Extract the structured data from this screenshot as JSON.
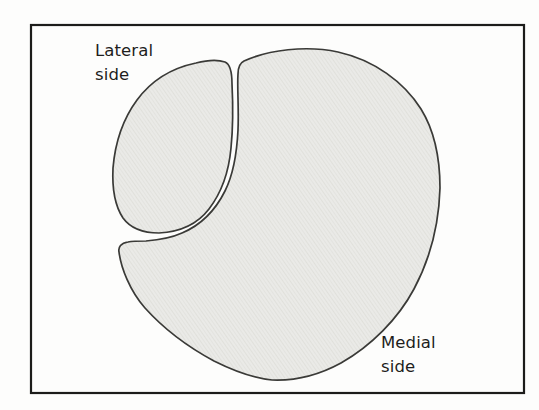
{
  "figure": {
    "labels": {
      "lateral": "Lateral\nside",
      "medial": "Medial\nside"
    },
    "colors": {
      "background": "#fdfdfc",
      "border": "#1c1c1a",
      "shape_fill": "#eaeae7",
      "shape_texture_line": "#e0e0db",
      "shape_outline": "#3a3a37",
      "text": "#1e1e1c"
    }
  }
}
